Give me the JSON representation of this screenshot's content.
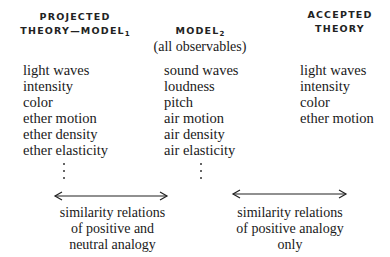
{
  "columns": [
    {
      "header_lines": [
        "PROJECTED",
        "THEORY—MODEL"
      ],
      "header_subscript": "1",
      "items": [
        "light waves",
        "intensity",
        "color",
        "ether motion",
        "ether density",
        "ether elasticity"
      ],
      "continuation": "⋮"
    },
    {
      "header_lines": [
        "MODEL"
      ],
      "header_subscript": "2",
      "subtitle": "(all observables)",
      "items": [
        "sound waves",
        "loudness",
        "pitch",
        "air motion",
        "air density",
        "air elasticity"
      ],
      "continuation": "⋮"
    },
    {
      "header_lines": [
        "ACCEPTED",
        "THEORY"
      ],
      "items": [
        "light waves",
        "intensity",
        "color",
        "ether motion"
      ]
    }
  ],
  "relations": [
    {
      "icon": "double-arrow-icon",
      "caption_lines": [
        "similarity relations",
        "of positive and",
        "neutral analogy"
      ]
    },
    {
      "icon": "double-arrow-icon",
      "caption_lines": [
        "similarity relations",
        "of positive analogy",
        "only"
      ]
    }
  ]
}
